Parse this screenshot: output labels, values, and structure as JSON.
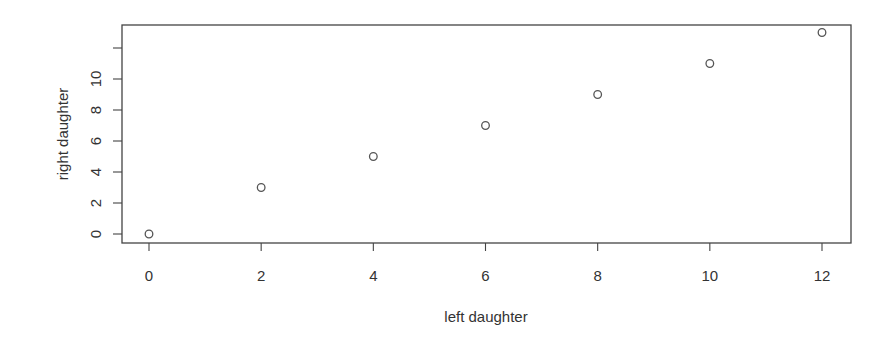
{
  "chart_data": {
    "type": "scatter",
    "title": "",
    "xlabel": "left daughter",
    "ylabel": "right daughter",
    "x": [
      0,
      2,
      4,
      6,
      8,
      10,
      12
    ],
    "y": [
      0,
      3,
      5,
      7,
      9,
      11,
      13
    ],
    "series": [
      {
        "name": "points",
        "marker": "open-circle",
        "x": [
          0,
          2,
          4,
          6,
          8,
          10,
          12
        ],
        "y": [
          0,
          3,
          5,
          7,
          9,
          11,
          13
        ]
      }
    ],
    "xticks": [
      0,
      2,
      4,
      6,
      8,
      10,
      12
    ],
    "xtick_labels": [
      "0",
      "2",
      "4",
      "6",
      "8",
      "10",
      "12"
    ],
    "yticks": [
      0,
      2,
      4,
      6,
      8,
      10,
      12
    ],
    "ytick_labels": [
      "0",
      "2",
      "4",
      "6",
      "8",
      "10",
      ""
    ],
    "xlim": [
      -0.48,
      12.48
    ],
    "ylim": [
      -0.6,
      13.6
    ],
    "grid": false,
    "legend": null
  },
  "colors": {
    "axis": "#444444",
    "text": "#333333",
    "marker": "#555555",
    "background": "#ffffff"
  }
}
